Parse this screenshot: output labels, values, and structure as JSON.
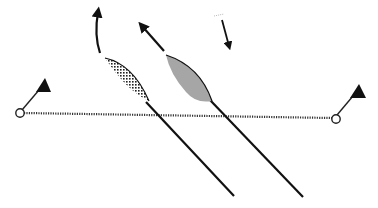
{
  "diagram": {
    "type": "sailing-start-diagram",
    "colors": {
      "ink": "#111111",
      "boat_b_fill": "#a6a6a6",
      "boat_a_pattern": "#222222",
      "start_line": "#333333",
      "background": "#ffffff"
    },
    "marks": [
      {
        "id": "left-mark",
        "x": 20,
        "y": 113,
        "flag_side": "right"
      },
      {
        "id": "right-mark",
        "x": 336,
        "y": 119,
        "flag_side": "right"
      }
    ],
    "start_line": {
      "from": [
        22,
        113
      ],
      "to": [
        334,
        118
      ],
      "style": "dotted"
    },
    "boats": [
      {
        "id": "boat-a",
        "fill": "dotted-pattern",
        "bow": [
          105,
          58
        ],
        "stern": [
          149,
          102
        ],
        "track_end": [
          234,
          196
        ],
        "heading_arrow": "curved-up"
      },
      {
        "id": "boat-b",
        "fill": "gray",
        "bow": [
          166,
          55
        ],
        "stern": [
          212,
          102
        ],
        "track_end": [
          303,
          197
        ],
        "heading_arrow": "up-left"
      }
    ],
    "wind_arrow": {
      "from": [
        222,
        20
      ],
      "to": [
        230,
        50
      ]
    }
  }
}
